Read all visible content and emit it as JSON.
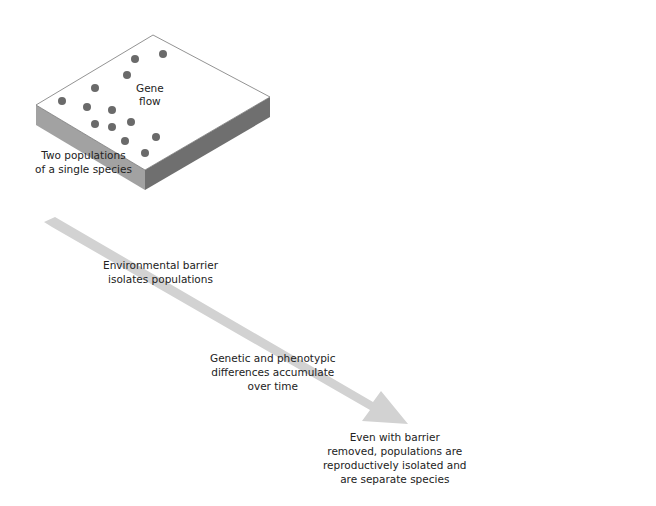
{
  "diagram": {
    "colors": {
      "ground_top": "#ffffff",
      "ground_side_left": "#9a9a9a",
      "ground_side_right": "#6c6c6c",
      "dot": "#6a6a6a",
      "dot_light": "#8a8a8a",
      "barrier_light": "#8d8d8d",
      "barrier_dark": "#5e5e5e",
      "time_arrow": "#cfcfcf"
    },
    "stages": [
      {
        "id": "stage1",
        "caption": "Two populations\nof a single species",
        "annotation": "Gene\nflow"
      },
      {
        "id": "stage2",
        "caption": "Environmental barrier\nisolates populations"
      },
      {
        "id": "stage3",
        "caption": "Genetic and phenotypic\ndifferences accumulate\nover time"
      },
      {
        "id": "stage4",
        "caption": "Even with barrier\nremoved, populations are\nreproductively isolated and\nare separate species"
      }
    ]
  }
}
